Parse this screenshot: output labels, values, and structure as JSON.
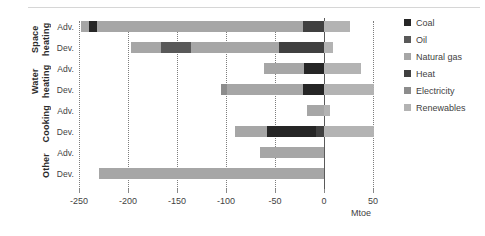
{
  "chart_data": {
    "type": "bar",
    "orientation": "horizontal",
    "stacked": true,
    "title": "",
    "xlabel": "Mtoe",
    "ylabel": "",
    "xlim": [
      -250,
      50
    ],
    "xticks": [
      -250,
      -200,
      -150,
      -100,
      -50,
      0,
      50
    ],
    "xtick_labels": [
      "-250",
      "-200",
      "-150",
      "-100",
      "-50",
      "0",
      "50"
    ],
    "grid": "vertical-dotted",
    "legend_position": "right",
    "groups": [
      {
        "name": "Space heating",
        "rows": [
          {
            "label": "Adv.",
            "total_negative": -248,
            "total_positive": 27,
            "segments": [
              {
                "series": "Natural gas",
                "start": -248,
                "end": -240
              },
              {
                "series": "Coal",
                "start": -240,
                "end": -232
              },
              {
                "series": "Natural gas",
                "start": -232,
                "end": -21
              },
              {
                "series": "Heat",
                "start": -21,
                "end": 0
              },
              {
                "series": "Renewables",
                "start": 0,
                "end": 27
              }
            ]
          },
          {
            "label": "Dev.",
            "total_negative": -197,
            "total_positive": 9,
            "segments": [
              {
                "series": "Natural gas",
                "start": -197,
                "end": -166
              },
              {
                "series": "Oil",
                "start": -166,
                "end": -136
              },
              {
                "series": "Natural gas",
                "start": -136,
                "end": -46
              },
              {
                "series": "Heat",
                "start": -46,
                "end": 0
              },
              {
                "series": "Renewables",
                "start": 0,
                "end": 9
              }
            ]
          }
        ]
      },
      {
        "name": "Water heating",
        "rows": [
          {
            "label": "Adv.",
            "total_negative": -61,
            "total_positive": 38,
            "segments": [
              {
                "series": "Natural gas",
                "start": -61,
                "end": -20
              },
              {
                "series": "Coal",
                "start": -20,
                "end": 0
              },
              {
                "series": "Renewables",
                "start": 0,
                "end": 38
              }
            ]
          },
          {
            "label": "Dev.",
            "total_negative": -105,
            "total_positive": 51,
            "segments": [
              {
                "series": "Electricity",
                "start": -105,
                "end": -99
              },
              {
                "series": "Natural gas",
                "start": -99,
                "end": -21
              },
              {
                "series": "Coal",
                "start": -21,
                "end": 0
              },
              {
                "series": "Renewables",
                "start": 0,
                "end": 51
              }
            ]
          }
        ]
      },
      {
        "name": "Cooking",
        "rows": [
          {
            "label": "Adv.",
            "total_negative": -17,
            "total_positive": 6,
            "segments": [
              {
                "series": "Natural gas",
                "start": -17,
                "end": 0
              },
              {
                "series": "Renewables",
                "start": 0,
                "end": 6
              }
            ]
          },
          {
            "label": "Dev.",
            "total_negative": -91,
            "total_positive": 51,
            "segments": [
              {
                "series": "Natural gas",
                "start": -91,
                "end": -58
              },
              {
                "series": "Coal",
                "start": -58,
                "end": -8
              },
              {
                "series": "Heat",
                "start": -8,
                "end": 0
              },
              {
                "series": "Renewables",
                "start": 0,
                "end": 51
              }
            ]
          }
        ]
      },
      {
        "name": "Other",
        "rows": [
          {
            "label": "Adv.",
            "total_negative": -65,
            "total_positive": 0,
            "segments": [
              {
                "series": "Natural gas",
                "start": -65,
                "end": 0
              }
            ]
          },
          {
            "label": "Dev.",
            "total_negative": -230,
            "total_positive": 0,
            "segments": [
              {
                "series": "Natural gas",
                "start": -230,
                "end": 0
              }
            ]
          }
        ]
      }
    ],
    "legend": [
      {
        "label": "Coal",
        "color": "#262626"
      },
      {
        "label": "Oil",
        "color": "#595959"
      },
      {
        "label": "Natural gas",
        "color": "#a6a6a6"
      },
      {
        "label": "Heat",
        "color": "#404040"
      },
      {
        "label": "Electricity",
        "color": "#8c8c8c"
      },
      {
        "label": "Renewables",
        "color": "#b3b3b3"
      }
    ],
    "series_colors": {
      "Coal": "#262626",
      "Oil": "#595959",
      "Natural gas": "#a6a6a6",
      "Heat": "#404040",
      "Electricity": "#8c8c8c",
      "Renewables": "#b3b3b3"
    }
  }
}
